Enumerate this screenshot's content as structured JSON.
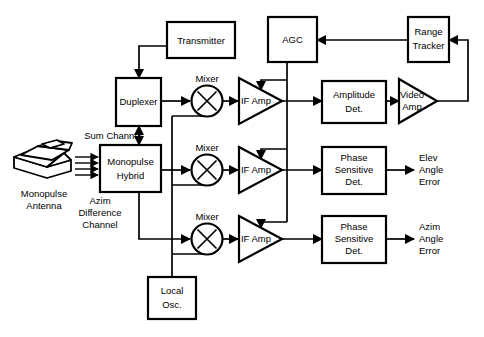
{
  "diagram": {
    "type": "block-diagram",
    "stroke_color": "#000000",
    "fill_color": "#ffffff",
    "background": "#ffffff"
  },
  "blocks": {
    "transmitter": {
      "label": "Transmitter",
      "shape": "rect"
    },
    "duplexer": {
      "label": "Duplexer",
      "shape": "rect"
    },
    "monopulse_hybrid": {
      "line1": "Monopulse",
      "line2": "Hybrid",
      "shape": "rect"
    },
    "local_osc": {
      "line1": "Local",
      "line2": "Osc.",
      "shape": "rect"
    },
    "agc": {
      "label": "AGC",
      "shape": "rect"
    },
    "range_tracker": {
      "line1": "Range",
      "line2": "Tracker",
      "shape": "rect"
    },
    "amplitude_det": {
      "line1": "Amplitude",
      "line2": "Det.",
      "shape": "rect"
    },
    "phase_det_1": {
      "line1": "Phase",
      "line2": "Sensitive",
      "line3": "Det.",
      "shape": "rect"
    },
    "phase_det_2": {
      "line1": "Phase",
      "line2": "Sensitive",
      "line3": "Det.",
      "shape": "rect"
    },
    "mixer_1": {
      "label": "Mixer",
      "shape": "circle-x"
    },
    "mixer_2": {
      "label": "Mixer",
      "shape": "circle-x"
    },
    "mixer_3": {
      "label": "Mixer",
      "shape": "circle-x"
    },
    "if_amp_1": {
      "label": "IF Amp",
      "shape": "triangle"
    },
    "if_amp_2": {
      "label": "IF Amp",
      "shape": "triangle"
    },
    "if_amp_3": {
      "label": "IF Amp",
      "shape": "triangle"
    },
    "video_amp": {
      "line1": "Video",
      "line2": "Amp",
      "shape": "triangle"
    },
    "antenna": {
      "line1": "Monopulse",
      "line2": "Antenna",
      "shape": "antenna-icon"
    }
  },
  "wire_labels": {
    "sum_channel": "Sum Channel",
    "azim_difference": {
      "line1": "Azim",
      "line2": "Difference",
      "line3": "Channel"
    }
  },
  "outputs": {
    "elev_error": {
      "line1": "Elev",
      "line2": "Angle",
      "line3": "Error"
    },
    "azim_error": {
      "line1": "Azim",
      "line2": "Angle",
      "line3": "Error"
    }
  }
}
